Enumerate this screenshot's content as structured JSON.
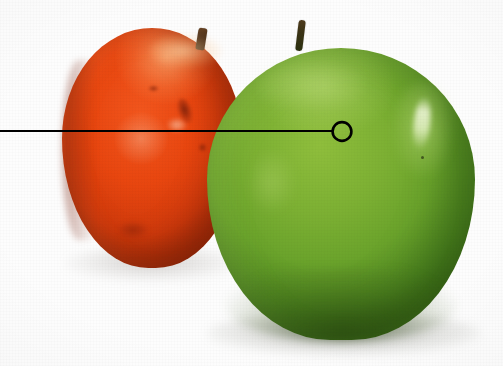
{
  "image": {
    "title": "Two apples with leader-line callout",
    "width": 503,
    "height": 366,
    "background_color": "#fdfdfd",
    "description": "Photograph of a red apple behind a green apple on a white background, with a black leader line running from the left edge to a small open circle marker on the green apple."
  },
  "objects": {
    "red_apple": {
      "label": "red apple",
      "color": "#e8460f",
      "shadow_color": "#7e2207",
      "stem_color": "#4a2f18",
      "position": "back-left",
      "bounds": {
        "x": 62,
        "y": 28,
        "width": 180,
        "height": 240
      }
    },
    "green_apple": {
      "label": "green apple",
      "color": "#7cb033",
      "shadow_color": "#3b6a18",
      "highlight_color": "#f8fce6",
      "stem_color": "#3b3315",
      "position": "front-right",
      "bounds": {
        "x": 207,
        "y": 48,
        "width": 268,
        "height": 292
      }
    }
  },
  "callout": {
    "label": "leader line callout",
    "line_color": "#000000",
    "line_width": 2,
    "line_start": {
      "x": 0,
      "y": 131
    },
    "line_end": {
      "x": 332,
      "y": 131
    },
    "marker": {
      "type": "circle",
      "label": "callout target marker",
      "center": {
        "x": 342,
        "y": 131
      },
      "radius": 9,
      "stroke_color": "#000000",
      "stroke_width": 2.6,
      "fill": "none"
    }
  }
}
